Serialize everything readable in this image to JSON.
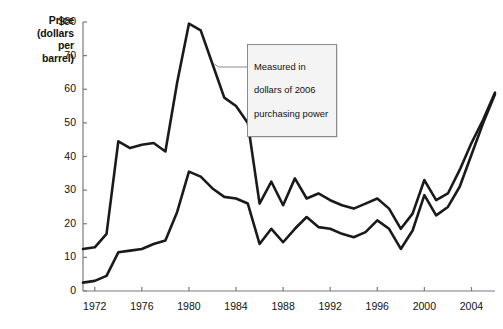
{
  "chart_data": {
    "type": "line",
    "title": "",
    "xlabel": "",
    "ylabel": "Price\n(dollars\nper\nbarrel)",
    "ylabel_lines": [
      "Price",
      "(dollars",
      "per",
      "barrel)"
    ],
    "xlim": [
      1971,
      2006
    ],
    "ylim": [
      0,
      80
    ],
    "grid": false,
    "legend": "none",
    "y_ticks": [
      0,
      10,
      20,
      30,
      40,
      50,
      60,
      70,
      80
    ],
    "y_tick_labels": [
      "0",
      "10",
      "20",
      "30",
      "40",
      "50",
      "60",
      "70",
      "$80"
    ],
    "x_ticks": [
      1972,
      1976,
      1980,
      1984,
      1988,
      1992,
      1996,
      2000,
      2004
    ],
    "x_tick_labels": [
      "1972",
      "1976",
      "1980",
      "1984",
      "1988",
      "1992",
      "1996",
      "2000",
      "2004"
    ],
    "x": [
      1971,
      1972,
      1973,
      1974,
      1975,
      1976,
      1977,
      1978,
      1979,
      1980,
      1981,
      1982,
      1983,
      1984,
      1985,
      1986,
      1987,
      1988,
      1989,
      1990,
      1991,
      1992,
      1993,
      1994,
      1995,
      1996,
      1997,
      1998,
      1999,
      2000,
      2001,
      2002,
      2003,
      2004,
      2005,
      2006
    ],
    "series": [
      {
        "name": "Real price (2006 dollars)",
        "color": "#1a1a1a",
        "values": [
          12.5,
          13.0,
          17.0,
          44.5,
          42.5,
          43.5,
          44.0,
          41.5,
          62.0,
          79.5,
          77.5,
          67.5,
          57.5,
          55.0,
          50.0,
          26.0,
          32.5,
          25.5,
          33.5,
          27.5,
          29.0,
          27.0,
          25.5,
          24.5,
          26.0,
          27.5,
          24.5,
          18.5,
          23.0,
          33.0,
          27.0,
          29.0,
          36.0,
          44.0,
          51.0,
          59.0
        ]
      },
      {
        "name": "Nominal price",
        "color": "#1a1a1a",
        "values": [
          2.5,
          3.0,
          4.5,
          11.5,
          12.0,
          12.5,
          14.0,
          15.0,
          23.5,
          35.5,
          34.0,
          30.5,
          28.0,
          27.5,
          26.0,
          14.0,
          18.5,
          14.5,
          18.5,
          22.0,
          19.0,
          18.5,
          17.0,
          16.0,
          17.5,
          21.0,
          18.5,
          12.5,
          18.0,
          28.5,
          22.5,
          25.0,
          31.0,
          40.5,
          50.0,
          58.5
        ]
      }
    ],
    "annotation": {
      "text": "Measured in\ndollars of 2006\npurchasing power",
      "lines": [
        "Measured in",
        "dollars of 2006",
        "purchasing power"
      ],
      "points_to_series": "Real price (2006 dollars)"
    }
  },
  "colors": {
    "line": "#1a1a1a",
    "axis": "#7a7a7a",
    "callout_border": "#8a8a8a",
    "callout_fill": "#f4f4f4",
    "background": "#ffffff"
  }
}
